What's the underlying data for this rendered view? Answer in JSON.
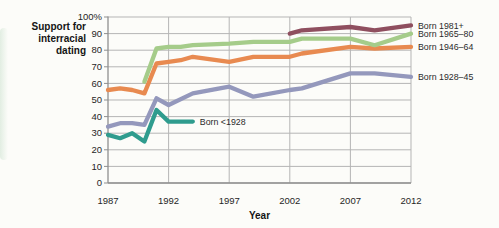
{
  "figure": {
    "y_axis_title": "Support for\ninterracial\ndating",
    "x_axis_label": "Year"
  },
  "colors": {
    "background": "#fcfcf9",
    "grid": "#b5b5b5",
    "axis": "#8f8f8f",
    "text": "#262626"
  },
  "chart_data": {
    "type": "line",
    "title": "Support for interracial dating",
    "xlabel": "Year",
    "ylabel": "Support for interracial dating (%)",
    "xlim": [
      1987,
      2012
    ],
    "ylim": [
      0,
      100
    ],
    "grid": true,
    "legend_position": "right of line ends",
    "x_ticks": [
      1987,
      1992,
      1997,
      2002,
      2007,
      2012
    ],
    "y_tick_values": [
      100,
      90,
      80,
      70,
      60,
      50,
      40,
      30,
      20,
      10,
      0
    ],
    "y_tick_labels": [
      "100%",
      "90",
      "80",
      "70",
      "60",
      "50",
      "40",
      "30",
      "20",
      "10",
      "0"
    ],
    "series": [
      {
        "name": "Born 1928–45",
        "color": "#9498bc",
        "label_placement": "right",
        "points": [
          [
            1987,
            34
          ],
          [
            1988,
            36
          ],
          [
            1989,
            36
          ],
          [
            1990,
            35
          ],
          [
            1991,
            51
          ],
          [
            1992,
            47
          ],
          [
            1994,
            54
          ],
          [
            1997,
            58
          ],
          [
            1999,
            52
          ],
          [
            2002,
            56
          ],
          [
            2003,
            57
          ],
          [
            2007,
            66
          ],
          [
            2009,
            66
          ],
          [
            2012,
            64
          ]
        ]
      },
      {
        "name": "Born <1928",
        "color": "#2f9c8e",
        "label_placement": "line-end",
        "points": [
          [
            1987,
            29
          ],
          [
            1988,
            27
          ],
          [
            1989,
            30
          ],
          [
            1990,
            25
          ],
          [
            1991,
            44
          ],
          [
            1992,
            37
          ],
          [
            1993,
            37
          ],
          [
            1994,
            37
          ]
        ]
      },
      {
        "name": "Born 1946–64",
        "color": "#e88a50",
        "label_placement": "right",
        "points": [
          [
            1987,
            56
          ],
          [
            1988,
            57
          ],
          [
            1989,
            56
          ],
          [
            1990,
            54
          ],
          [
            1991,
            72
          ],
          [
            1992,
            73
          ],
          [
            1993,
            74
          ],
          [
            1994,
            76
          ],
          [
            1997,
            73
          ],
          [
            1999,
            76
          ],
          [
            2002,
            76
          ],
          [
            2003,
            78
          ],
          [
            2007,
            82
          ],
          [
            2009,
            81
          ],
          [
            2012,
            82
          ]
        ]
      },
      {
        "name": "Born 1965–80",
        "color": "#a5cc8a",
        "label_placement": "right",
        "points": [
          [
            1990,
            61
          ],
          [
            1991,
            81
          ],
          [
            1992,
            82
          ],
          [
            1993,
            82
          ],
          [
            1994,
            83
          ],
          [
            1997,
            84
          ],
          [
            1999,
            85
          ],
          [
            2002,
            85
          ],
          [
            2003,
            87
          ],
          [
            2007,
            87
          ],
          [
            2009,
            83
          ],
          [
            2012,
            90
          ]
        ]
      },
      {
        "name": "Born 1981+",
        "color": "#8f4f5f",
        "label_placement": "right",
        "points": [
          [
            2002,
            90
          ],
          [
            2003,
            92
          ],
          [
            2007,
            94
          ],
          [
            2009,
            92
          ],
          [
            2012,
            95
          ]
        ]
      }
    ]
  }
}
